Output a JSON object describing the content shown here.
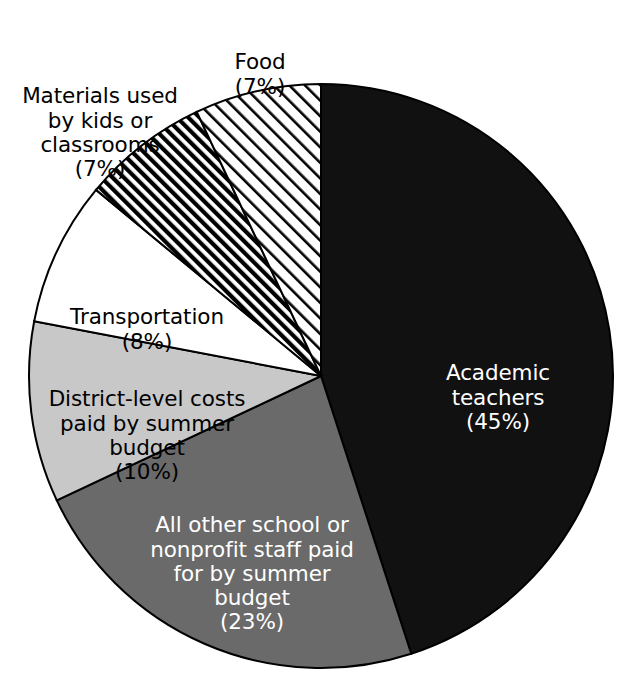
{
  "chart_data": {
    "type": "pie",
    "title": "",
    "subtitle": "",
    "xlabel": "",
    "ylabel": "",
    "legend_position": "none",
    "grid": false,
    "units": "percent",
    "start_angle_deg": 0,
    "direction": "clockwise",
    "categories": [
      "Academic teachers",
      "All other school or nonprofit staff paid for by summer budget",
      "District-level costs paid by summer budget",
      "Transportation",
      "Materials used by kids or classrooms",
      "Food"
    ],
    "values": [
      45,
      23,
      10,
      8,
      7,
      7
    ],
    "slices": [
      {
        "name": "academic-teachers",
        "label": "Academic\nteachers",
        "percent_text": "(45%)",
        "value": 45,
        "fill": "#111111",
        "fill_style": "solid",
        "text_color": "#ffffff",
        "label_placement": "inside"
      },
      {
        "name": "all-other-staff",
        "label": "All other school or\nnonprofit staff paid\nfor by summer\nbudget",
        "percent_text": "(23%)",
        "value": 23,
        "fill": "#6a6a6a",
        "fill_style": "solid",
        "text_color": "#ffffff",
        "label_placement": "inside"
      },
      {
        "name": "district-level-costs",
        "label": "District-level costs\npaid by summer\nbudget",
        "percent_text": "(10%)",
        "value": 10,
        "fill": "#c8c8c8",
        "fill_style": "solid",
        "text_color": "#000000",
        "label_placement": "inside"
      },
      {
        "name": "transportation",
        "label": "Transportation",
        "percent_text": "(8%)",
        "value": 8,
        "fill": "#ffffff",
        "fill_style": "solid",
        "text_color": "#000000",
        "label_placement": "inside"
      },
      {
        "name": "materials-used-by-kids",
        "label": "Materials used\nby kids or\nclassrooms",
        "percent_text": "(7%)",
        "value": 7,
        "fill": "#ffffff",
        "fill_style": "dense-diagonal-hatch",
        "text_color": "#000000",
        "label_placement": "outside"
      },
      {
        "name": "food",
        "label": "Food",
        "percent_text": "(7%)",
        "value": 7,
        "fill": "#ffffff",
        "fill_style": "sparse-diagonal-hatch",
        "text_color": "#000000",
        "label_placement": "outside"
      }
    ]
  },
  "style": {
    "background": "#ffffff",
    "outline_color": "#000000",
    "black_slice": "#111111",
    "dark_gray_slice": "#6a6a6a",
    "light_gray_slice": "#c8c8c8",
    "white_slice": "#ffffff"
  }
}
